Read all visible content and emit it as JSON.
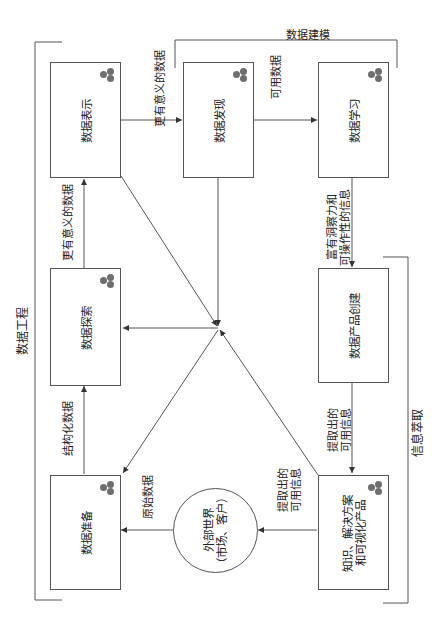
{
  "boxes": {
    "representation": "数据表示",
    "discovery": "数据发现",
    "learning": "数据学习",
    "exploration": "数据探索",
    "product_creation": "数据产品创建",
    "preparation": "数据准备",
    "knowledge_line1": "知识、解决方案",
    "knowledge_line2": "和可视化产品"
  },
  "external": {
    "line1": "外部世界",
    "line2": "（市场、客户）"
  },
  "edges": {
    "more_meaningful_data_top": "更有意义的数据",
    "usable_data": "可用数据",
    "more_meaningful_data_left": "更有意义的数据",
    "insight_line1": "富有洞察力和",
    "insight_line2": "可操作性的信息",
    "structured_data": "结构化数据",
    "raw_data": "原始数据",
    "extracted_info_right_line1": "提取出的",
    "extracted_info_right_line2": "可用信息",
    "extracted_info_bottom_line1": "提取出的",
    "extracted_info_bottom_line2": "可用信息"
  },
  "groups": {
    "data_engineering": "数据工程",
    "data_modeling": "数据建模",
    "information_extraction": "信息萃取"
  },
  "colors": {
    "line": "#555555",
    "dot": "#6e6e6e"
  }
}
